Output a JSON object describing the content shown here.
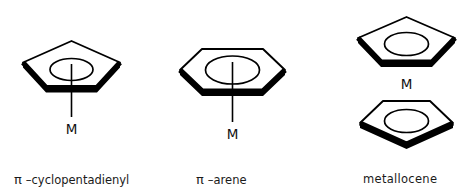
{
  "figure": {
    "title": "",
    "background_color": "#ffffff",
    "ink_color": "#000000",
    "structures": [
      {
        "id": "pi-cyclopentadienyl",
        "ring": "pentagon",
        "ring_atoms": 5,
        "orientation": "apex-up",
        "has_bond_line": true,
        "metal_label": "M",
        "inner_marker": "ellipse-with-tick",
        "caption_pi": "π",
        "caption_dash": "–",
        "caption_name": "cyclopentadienyl",
        "caption_full": "π –cyclopentadienyl"
      },
      {
        "id": "pi-arene",
        "ring": "hexagon",
        "ring_atoms": 6,
        "orientation": "flat-top",
        "has_bond_line": true,
        "metal_label": "M",
        "inner_marker": "ellipse-with-tick",
        "caption_pi": "π",
        "caption_dash": "–",
        "caption_name": "arene",
        "caption_full": "π –arene"
      },
      {
        "id": "metallocene",
        "ring": "two-pentagons",
        "ring_atoms": 5,
        "orientation": "sandwich",
        "has_bond_line": false,
        "metal_label": "M",
        "inner_marker": "ellipse",
        "caption_pi": "",
        "caption_dash": "",
        "caption_name": "metallocene",
        "caption_full": "metallocene"
      }
    ]
  },
  "labels": {
    "metal_1": "M",
    "metal_2": "M",
    "metal_3": "M"
  },
  "captions": {
    "cyclopentadienyl_pi": "π",
    "cyclopentadienyl_rest": " –cyclopentadienyl",
    "arene_pi": "π",
    "arene_rest": " –arene",
    "metallocene": "metallocene"
  }
}
